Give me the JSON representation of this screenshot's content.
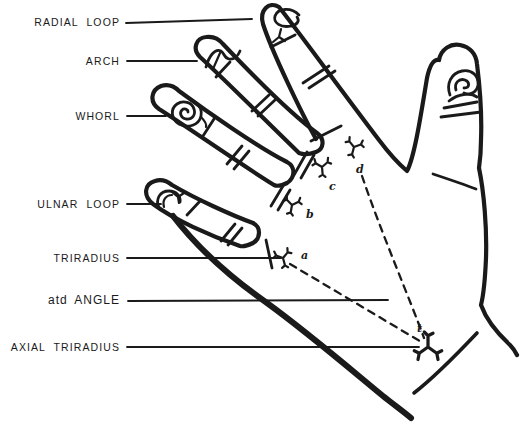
{
  "palette": {
    "ink": "#1a1a1a",
    "paper": "#ffffff"
  },
  "labels": {
    "radial_loop": "RADIAL LOOP",
    "arch": "ARCH",
    "whorl": "WHORL",
    "ulnar_loop": "ULNAR LOOP",
    "triradius": "TRIRADIUS",
    "atd_angle": "atd ANGLE",
    "axial_triradius": "AXIAL TRIRADIUS"
  },
  "point_letters": {
    "a": "a",
    "b": "b",
    "c": "c",
    "d": "d",
    "t": "t"
  }
}
